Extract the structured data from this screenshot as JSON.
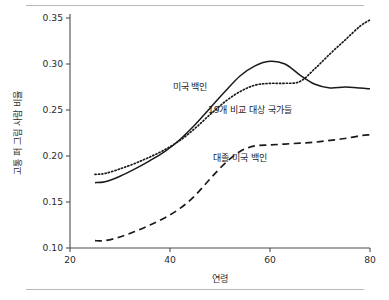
{
  "figure": {
    "background_color": "#ffffff",
    "rule_color": "#b9b9b9",
    "axis_color": "#4d4d4d",
    "line_color": "#1a1a1a"
  },
  "chart_data": {
    "type": "line",
    "title": "",
    "xlabel": "연령",
    "ylabel": "고통 퍼 그림 사람 비율",
    "xlim": [
      20,
      80
    ],
    "ylim": [
      0.1,
      0.35
    ],
    "xticks": [
      20,
      40,
      60,
      80
    ],
    "xtick_labels": [
      "20",
      "40",
      "60",
      "80"
    ],
    "yticks": [
      0.1,
      0.15,
      0.2,
      0.25,
      0.3,
      0.35
    ],
    "ytick_labels": [
      "0.10",
      "0.15",
      "0.20",
      "0.25",
      "0.30",
      "0.35"
    ],
    "grid": false,
    "legend_position": "inline-annotations",
    "series": [
      {
        "name": "미국 백인",
        "style": "solid",
        "label_x": 44,
        "label_y": 0.272,
        "x": [
          25,
          27,
          30,
          33,
          36,
          39,
          42,
          45,
          48,
          51,
          54,
          57,
          60,
          63,
          66,
          69,
          72,
          75,
          78,
          80
        ],
        "values": [
          0.171,
          0.172,
          0.178,
          0.186,
          0.195,
          0.205,
          0.218,
          0.234,
          0.252,
          0.27,
          0.287,
          0.298,
          0.303,
          0.3,
          0.288,
          0.278,
          0.274,
          0.275,
          0.274,
          0.273
        ]
      },
      {
        "name": "19개 비교 대상 국가들",
        "style": "dotted",
        "label_x": 56,
        "label_y": 0.247,
        "x": [
          25,
          27,
          30,
          33,
          36,
          39,
          42,
          45,
          48,
          51,
          54,
          57,
          60,
          63,
          66,
          69,
          72,
          75,
          78,
          80
        ],
        "values": [
          0.18,
          0.181,
          0.186,
          0.192,
          0.199,
          0.207,
          0.217,
          0.23,
          0.245,
          0.259,
          0.27,
          0.277,
          0.279,
          0.279,
          0.281,
          0.295,
          0.311,
          0.326,
          0.341,
          0.348
        ]
      },
      {
        "name": "대졸 미국 백인",
        "style": "dashed",
        "label_x": 54,
        "label_y": 0.195,
        "x": [
          25,
          27,
          30,
          33,
          36,
          39,
          42,
          45,
          48,
          51,
          54,
          57,
          60,
          63,
          66,
          69,
          72,
          75,
          78,
          80
        ],
        "values": [
          0.108,
          0.108,
          0.112,
          0.118,
          0.125,
          0.133,
          0.143,
          0.157,
          0.175,
          0.192,
          0.205,
          0.211,
          0.212,
          0.213,
          0.214,
          0.215,
          0.217,
          0.219,
          0.222,
          0.223
        ]
      }
    ]
  }
}
